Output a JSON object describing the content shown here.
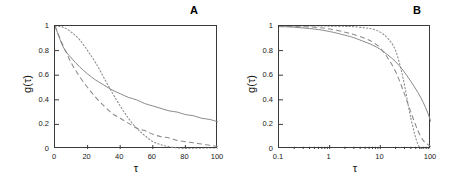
{
  "figure": {
    "background": "#ffffff",
    "curve_color": "#8a8a8a",
    "axis_color": "#3a3a3a"
  },
  "panels": [
    {
      "id": "A",
      "label": "A",
      "xlabel": "τ",
      "ylabel": "g(τ)",
      "xscale": "linear",
      "xticks": [
        "0",
        "20",
        "40",
        "60",
        "80",
        "100"
      ],
      "yticks": [
        "0",
        "0.2",
        "0.4",
        "0.6",
        "0.8",
        "1"
      ]
    },
    {
      "id": "B",
      "label": "B",
      "xlabel": "τ",
      "ylabel": "g(τ)",
      "xscale": "log",
      "xticks": [
        "0.1",
        "1",
        "10",
        "100"
      ],
      "yticks": [
        "0",
        "0.2",
        "0.4",
        "0.6",
        "0.8",
        "1"
      ]
    }
  ],
  "chart_data": [
    {
      "type": "line",
      "panel": "A",
      "title": "",
      "xlabel": "τ",
      "ylabel": "g(τ)",
      "xscale": "linear",
      "xlim": [
        0,
        100
      ],
      "ylim": [
        0,
        1
      ],
      "xticks": [
        0,
        20,
        40,
        60,
        80,
        100
      ],
      "yticks": [
        0,
        0.2,
        0.4,
        0.6,
        0.8,
        1
      ],
      "grid": false,
      "legend": "none",
      "x": [
        0,
        5,
        10,
        15,
        20,
        25,
        30,
        35,
        40,
        45,
        50,
        55,
        60,
        65,
        70,
        75,
        80,
        85,
        90,
        95,
        100
      ],
      "series": [
        {
          "name": "stretched-exponential-beta-0.6",
          "style": "solid",
          "color": "#8a8a8a",
          "values": [
            1.0,
            0.83,
            0.74,
            0.67,
            0.61,
            0.56,
            0.52,
            0.48,
            0.45,
            0.42,
            0.4,
            0.37,
            0.35,
            0.33,
            0.31,
            0.3,
            0.28,
            0.27,
            0.25,
            0.24,
            0.22
          ]
        },
        {
          "name": "exponential-beta-1.0",
          "style": "dashed",
          "color": "#8a8a8a",
          "values": [
            1.0,
            0.84,
            0.7,
            0.59,
            0.5,
            0.42,
            0.35,
            0.29,
            0.25,
            0.21,
            0.17,
            0.15,
            0.12,
            0.1,
            0.09,
            0.07,
            0.06,
            0.05,
            0.04,
            0.03,
            0.02
          ]
        },
        {
          "name": "compressed-exponential-beta-2.0",
          "style": "dotted",
          "color": "#8a8a8a",
          "values": [
            1.0,
            0.99,
            0.95,
            0.89,
            0.8,
            0.7,
            0.58,
            0.46,
            0.35,
            0.25,
            0.17,
            0.11,
            0.06,
            0.035,
            0.018,
            0.009,
            0.004,
            0.002,
            0.001,
            0.0,
            0.0
          ]
        }
      ]
    },
    {
      "type": "line",
      "panel": "B",
      "title": "",
      "xlabel": "τ",
      "ylabel": "g(τ)",
      "xscale": "log",
      "xlim": [
        0.1,
        100
      ],
      "ylim": [
        0,
        1
      ],
      "xticks": [
        0.1,
        1,
        10,
        100
      ],
      "yticks": [
        0,
        0.2,
        0.4,
        0.6,
        0.8,
        1
      ],
      "grid": false,
      "legend": "none",
      "x": [
        0.1,
        0.2,
        0.5,
        1,
        2,
        3,
        5,
        7,
        10,
        14,
        20,
        28,
        40,
        55,
        70,
        85,
        100
      ],
      "series": [
        {
          "name": "stretched-exponential-beta-0.6",
          "style": "solid",
          "color": "#8a8a8a",
          "values": [
            0.995,
            0.99,
            0.975,
            0.955,
            0.925,
            0.905,
            0.87,
            0.845,
            0.81,
            0.765,
            0.71,
            0.64,
            0.55,
            0.46,
            0.38,
            0.3,
            0.22
          ]
        },
        {
          "name": "exponential-beta-1.0",
          "style": "dashed",
          "color": "#8a8a8a",
          "values": [
            0.998,
            0.995,
            0.99,
            0.975,
            0.95,
            0.93,
            0.9,
            0.87,
            0.82,
            0.74,
            0.63,
            0.48,
            0.3,
            0.15,
            0.07,
            0.04,
            0.02
          ]
        },
        {
          "name": "compressed-exponential-beta-2.0",
          "style": "dotted",
          "color": "#8a8a8a",
          "values": [
            1.0,
            1.0,
            1.0,
            0.999,
            0.997,
            0.994,
            0.985,
            0.975,
            0.95,
            0.9,
            0.8,
            0.58,
            0.25,
            0.04,
            0.0,
            0.0,
            0.0
          ]
        }
      ]
    }
  ]
}
